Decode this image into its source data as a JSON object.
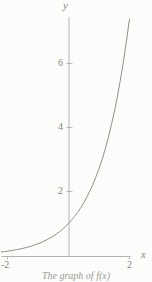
{
  "figure": {
    "background": "#fcfcfa",
    "axis_color": "#b4b2ae",
    "tick_color": "#a8a6a2",
    "curve_color": "#8b8279",
    "text_color": "#85837e",
    "y_axis_label": "y",
    "x_axis_label": "x",
    "y_tick_labels": [
      "6",
      "4",
      "2"
    ],
    "x_tick_labels": [
      "-2",
      "2"
    ],
    "caption": "The graph of f(x)"
  },
  "chart_data": {
    "type": "line",
    "title": "",
    "xlabel": "x",
    "ylabel": "y",
    "xlim": [
      -2.25,
      2.05
    ],
    "ylim": [
      0,
      7.55
    ],
    "x_ticks": [
      -2,
      2
    ],
    "y_ticks": [
      2,
      4,
      6
    ],
    "grid": false,
    "legend": "none",
    "series": [
      {
        "name": "y = e^x",
        "x": [
          -2.2,
          -2.1,
          -2.0,
          -1.9,
          -1.8,
          -1.7,
          -1.6,
          -1.5,
          -1.4,
          -1.3,
          -1.2,
          -1.1,
          -1.0,
          -0.9,
          -0.8,
          -0.7,
          -0.6,
          -0.5,
          -0.4,
          -0.3,
          -0.2,
          -0.1,
          0.0,
          0.1,
          0.2,
          0.3,
          0.4,
          0.5,
          0.6,
          0.7,
          0.8,
          0.9,
          1.0,
          1.1,
          1.2,
          1.3,
          1.4,
          1.5,
          1.6,
          1.7,
          1.8,
          1.9,
          2.0
        ],
        "y": [
          0.111,
          0.122,
          0.135,
          0.15,
          0.165,
          0.183,
          0.202,
          0.223,
          0.247,
          0.273,
          0.301,
          0.333,
          0.368,
          0.407,
          0.449,
          0.497,
          0.549,
          0.607,
          0.67,
          0.741,
          0.819,
          0.905,
          1.0,
          1.105,
          1.221,
          1.35,
          1.492,
          1.649,
          1.822,
          2.014,
          2.226,
          2.46,
          2.718,
          3.004,
          3.32,
          3.669,
          4.055,
          4.482,
          4.953,
          5.474,
          6.05,
          6.686,
          7.389
        ]
      }
    ]
  }
}
